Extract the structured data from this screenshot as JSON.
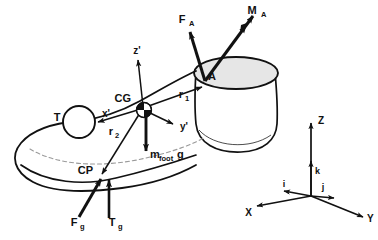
{
  "figure": {
    "type": "mechanics-free-body-diagram",
    "background_color": "#ffffff",
    "stroke_color": "#111111",
    "shank_fill_color": "#e8e8e8",
    "dashed_color": "#9a9a9a"
  },
  "body_segments": {
    "foot_outline": {
      "name": "foot",
      "fill": "#ffffff",
      "stroke": "#111111"
    },
    "shank": {
      "name": "shank-truncated-cone",
      "fill": "#ffffff",
      "stroke": "#111111"
    },
    "ankle_disc": {
      "name": "ankle-joint-ellipse",
      "fill": "#e6e6e6",
      "stroke": "#111111"
    },
    "toe_circle": {
      "name": "toe-marker-circle",
      "fill": "#ffffff",
      "stroke": "#111111"
    }
  },
  "points": [
    {
      "id": "A",
      "label": "A",
      "description": "ankle joint centre",
      "x": 205,
      "y": 81
    },
    {
      "id": "CG",
      "label": "CG",
      "description": "centre of gravity of foot",
      "x": 143,
      "y": 108
    },
    {
      "id": "CP",
      "label": "CP",
      "description": "centre of pressure",
      "x": 97,
      "y": 177
    },
    {
      "id": "T",
      "label": "T",
      "description": "toe marker",
      "x": 71,
      "y": 124
    }
  ],
  "vectors": [
    {
      "id": "F_A",
      "label": "F",
      "subscript": "A",
      "description": "ankle joint reaction force",
      "arrowheads": 1,
      "from": {
        "x": 205,
        "y": 81
      },
      "to": {
        "x": 189,
        "y": 30
      }
    },
    {
      "id": "M_A",
      "label": "M",
      "subscript": "A",
      "description": "ankle joint moment",
      "arrowheads": 2,
      "from": {
        "x": 205,
        "y": 81
      },
      "to": {
        "x": 254,
        "y": 14
      }
    },
    {
      "id": "mfootg",
      "label": "m",
      "subscript": "foot",
      "suffix": "g",
      "description": "gravitational force on foot",
      "arrowheads": 1,
      "from": {
        "x": 146,
        "y": 110
      },
      "to": {
        "x": 146,
        "y": 149
      }
    },
    {
      "id": "F_g",
      "label": "F",
      "subscript": "g",
      "description": "ground reaction force",
      "arrowheads": 1,
      "from": {
        "x": 79,
        "y": 218
      },
      "to": {
        "x": 100,
        "y": 180
      }
    },
    {
      "id": "T_g",
      "label": "T",
      "subscript": "g",
      "description": "ground reaction torque",
      "arrowheads": 1,
      "from": {
        "x": 109,
        "y": 219
      },
      "to": {
        "x": 109,
        "y": 181
      }
    },
    {
      "id": "r_1",
      "label": "r",
      "subscript": "1",
      "description": "position vector from CG to ankle A",
      "arrowheads": 1,
      "from": {
        "x": 143,
        "y": 108
      },
      "to": {
        "x": 201,
        "y": 86
      }
    },
    {
      "id": "r_2",
      "label": "r",
      "subscript": "2",
      "description": "position vector from CG to centre of pressure CP",
      "arrowheads": 1,
      "from": {
        "x": 143,
        "y": 108
      },
      "to": {
        "x": 101,
        "y": 175
      }
    }
  ],
  "local_axes": {
    "origin_label": "CG",
    "items": [
      {
        "id": "x_prime",
        "label": "x'",
        "description": "local anterior axis",
        "to": {
          "x": 97,
          "y": 121
        }
      },
      {
        "id": "y_prime",
        "label": "y'",
        "description": "local medio-lateral axis",
        "to": {
          "x": 175,
          "y": 125
        }
      },
      {
        "id": "z_prime",
        "label": "z'",
        "description": "local vertical axis",
        "to": {
          "x": 137,
          "y": 58
        }
      }
    ]
  },
  "global_frame": {
    "origin": {
      "x": 311,
      "y": 196
    },
    "axes": [
      {
        "id": "X",
        "label": "X",
        "description": "global X axis",
        "to": {
          "x": 255,
          "y": 207
        }
      },
      {
        "id": "Y",
        "label": "Y",
        "description": "global Y axis",
        "to": {
          "x": 365,
          "y": 218
        }
      },
      {
        "id": "Z",
        "label": "Z",
        "description": "global Z axis",
        "to": {
          "x": 311,
          "y": 121
        }
      }
    ],
    "unit_vectors": [
      {
        "id": "i",
        "label": "i",
        "description": "unit vector along X",
        "to": {
          "x": 282,
          "y": 191
        }
      },
      {
        "id": "j",
        "label": "j",
        "description": "unit vector along Y",
        "to": {
          "x": 336,
          "y": 199
        }
      },
      {
        "id": "k",
        "label": "k",
        "description": "unit vector along Z",
        "to": {
          "x": 311,
          "y": 159
        }
      }
    ]
  },
  "labels": {
    "A": "A",
    "CG": "CG",
    "CP": "CP",
    "T": "T",
    "F_A_base": "F",
    "F_A_sub": "A",
    "M_A_base": "M",
    "M_A_sub": "A",
    "mfoot_base": "m",
    "mfoot_sub": "foot",
    "mfoot_suffix": "g",
    "F_g_base": "F",
    "F_g_sub": "g",
    "T_g_base": "T",
    "T_g_sub": "g",
    "r1_base": "r",
    "r1_sub": "1",
    "r2_base": "r",
    "r2_sub": "2",
    "x_prime": "x'",
    "y_prime": "y'",
    "z_prime": "z'",
    "X": "X",
    "Y": "Y",
    "Z": "Z",
    "i": "i",
    "j": "j",
    "k": "k"
  }
}
